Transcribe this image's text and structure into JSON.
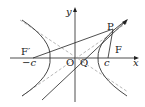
{
  "diagram": {
    "type": "hyperbola-with-foci",
    "axes": {
      "x_label": "x",
      "y_label": "y"
    },
    "points": {
      "origin": "O",
      "left_focus": "F′",
      "right_focus": "F",
      "point_on_curve": "P",
      "intersection": "Q"
    },
    "tick_labels": {
      "left": "−c",
      "right": "c"
    },
    "colors": {
      "curve": "#333333",
      "asymptote": "#999999",
      "line": "#222222"
    }
  }
}
